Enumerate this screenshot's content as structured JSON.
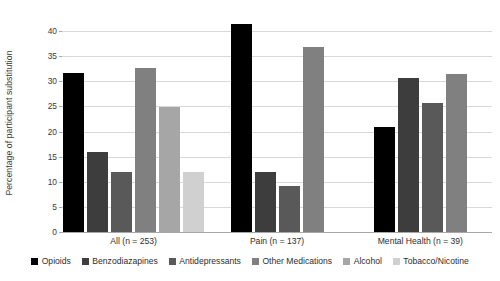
{
  "chart_data": {
    "type": "bar",
    "title": "",
    "xlabel": "",
    "ylabel": "Percentage of participant substitution",
    "ylim": [
      0,
      42
    ],
    "yticks": [
      0,
      5,
      10,
      15,
      20,
      25,
      30,
      35,
      40
    ],
    "ytick_labels": [
      "0",
      "5",
      "10",
      "15",
      "20",
      "25",
      "30",
      "35",
      "40"
    ],
    "grid": true,
    "legend_position": "bottom",
    "categories": [
      "All (n = 253)",
      "Pain (n = 137)",
      "Mental Health (n = 39)"
    ],
    "series": [
      {
        "name": "Opioids",
        "color": "#000000",
        "values": [
          31.6,
          41.5,
          21.0
        ]
      },
      {
        "name": "Benzodiazapines",
        "color": "#3d3d3d",
        "values": [
          15.9,
          12.0,
          30.7
        ]
      },
      {
        "name": "Antidepressants",
        "color": "#595959",
        "values": [
          11.9,
          9.1,
          25.6
        ]
      },
      {
        "name": "Other Medications",
        "color": "#808080",
        "values": [
          32.7,
          36.9,
          31.5
        ]
      },
      {
        "name": "Alcohol",
        "color": "#a6a6a6",
        "values": [
          24.9,
          null,
          null
        ]
      },
      {
        "name": "Tobacco/Nicotine",
        "color": "#d0d0d0",
        "values": [
          11.9,
          null,
          null
        ]
      }
    ]
  }
}
